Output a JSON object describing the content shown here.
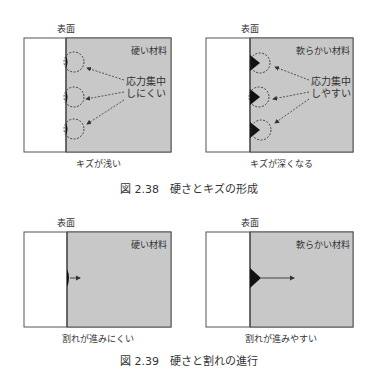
{
  "figure_238": {
    "caption": "図 2.38　硬さとキズの形成",
    "left_panel": {
      "surface_label": "表面",
      "material_label": "硬い材料",
      "annotation_line1": "応力集中",
      "annotation_line2": "しにくい",
      "bottom_label": "キズが浅い"
    },
    "right_panel": {
      "surface_label": "表面",
      "material_label": "軟らかい材料",
      "annotation_line1": "応力集中",
      "annotation_line2": "しやすい",
      "bottom_label": "キズが深くなる"
    }
  },
  "figure_239": {
    "caption": "図 2.39　硬さと割れの進行",
    "left_panel": {
      "surface_label": "表面",
      "material_label": "硬い材料",
      "bottom_label": "割れが進みにくい"
    },
    "right_panel": {
      "surface_label": "表面",
      "material_label": "軟らかい材料",
      "bottom_label": "割れが進みやすい"
    }
  },
  "colors": {
    "material_fill": "#c8c8c8",
    "border": "#555555",
    "flaw": "#111111"
  }
}
